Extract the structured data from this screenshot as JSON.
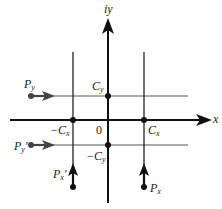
{
  "diagram": {
    "type": "complex-plane contour diagram",
    "colors": {
      "axis": "#111111",
      "line": "#333333",
      "thin_line": "#555555",
      "dot": "#111111",
      "background": "#ffffff"
    },
    "axes": {
      "x_label": "x",
      "y_label": "iy",
      "origin_label": "0"
    },
    "points": {
      "cy": {
        "main": "C",
        "sub": "y"
      },
      "neg_cy": {
        "main": "−C",
        "sub": "y"
      },
      "cx": {
        "main": "C",
        "sub": "x"
      },
      "neg_cx": {
        "main": "−C",
        "sub": "x"
      }
    },
    "sources": {
      "py": {
        "main": "P",
        "sub": "y",
        "prime": ""
      },
      "py_prime": {
        "main": "P",
        "sub": "y",
        "prime": "′"
      },
      "px": {
        "main": "P",
        "sub": "x",
        "prime": ""
      },
      "px_prime": {
        "main": "P",
        "sub": "x",
        "prime": "′"
      }
    }
  }
}
